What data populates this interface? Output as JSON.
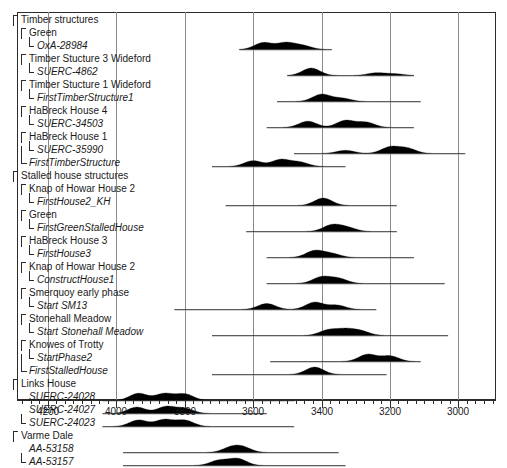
{
  "chart_data": {
    "type": "area",
    "title": "",
    "xlabel": "",
    "ylabel": "",
    "xlim": [
      4290,
      2890
    ],
    "x_axis_reversed": true,
    "grid": true,
    "legend": false,
    "axis_ticks_major": [
      4200,
      4000,
      3800,
      3600,
      3400,
      3200,
      3000
    ],
    "axis_tick_labels": [
      "4200",
      "4000",
      "3800",
      "3600",
      "3400",
      "3200",
      "3000"
    ],
    "axis_tick_minor_step": 25,
    "group_headers": [
      {
        "label": "Timber structures",
        "row": 0
      },
      {
        "label": "Stalled house structures",
        "row": 9
      }
    ],
    "rows": [
      {
        "label": "Timber structures",
        "kind": "group",
        "indent": 0,
        "bracket": "open"
      },
      {
        "label": "Green",
        "kind": "site",
        "indent": 1,
        "bracket": "open"
      },
      {
        "label": "OxA-28984",
        "kind": "date",
        "indent": 2,
        "bracket": "close",
        "range": [
          3640,
          3370
        ],
        "peaks": [
          [
            3570,
            1.0
          ],
          [
            3505,
            0.95
          ],
          [
            3455,
            0.55
          ]
        ]
      },
      {
        "label": "Timber Stucture 3 Wideford",
        "kind": "site",
        "indent": 1,
        "bracket": "open"
      },
      {
        "label": "SUERC-4862",
        "kind": "date",
        "indent": 2,
        "bracket": "close",
        "range": [
          3500,
          3130
        ],
        "peaks": [
          [
            3430,
            1.0
          ],
          [
            3240,
            0.35
          ],
          [
            3185,
            0.22
          ]
        ]
      },
      {
        "label": "Timber Stucture 1 Wideford",
        "kind": "site",
        "indent": 1,
        "bracket": "open"
      },
      {
        "label": "FirstTimberStructure1",
        "kind": "date",
        "indent": 2,
        "bracket": "close",
        "range": [
          3530,
          3110
        ],
        "peaks": [
          [
            3400,
            1.0
          ],
          [
            3340,
            0.45
          ]
        ]
      },
      {
        "label": "HaBreck House 4",
        "kind": "site",
        "indent": 1,
        "bracket": "open"
      },
      {
        "label": "SUERC-34503",
        "kind": "date",
        "indent": 2,
        "bracket": "close",
        "range": [
          3560,
          3130
        ],
        "peaks": [
          [
            3440,
            0.85
          ],
          [
            3330,
            0.95
          ],
          [
            3270,
            0.7
          ]
        ]
      },
      {
        "label": "HaBreck House 1",
        "kind": "site",
        "indent": 1,
        "bracket": "open"
      },
      {
        "label": "SUERC-35990",
        "kind": "date",
        "indent": 2,
        "bracket": "close",
        "range": [
          3480,
          2980
        ],
        "peaks": [
          [
            3330,
            0.5
          ],
          [
            3200,
            1.0
          ],
          [
            3150,
            0.8
          ]
        ]
      },
      {
        "label": "FirstTimberStructure",
        "kind": "derived",
        "indent": 1,
        "bracket": "close-long",
        "range": [
          3720,
          3330
        ],
        "peaks": [
          [
            3600,
            0.8
          ],
          [
            3520,
            0.95
          ],
          [
            3465,
            0.6
          ]
        ]
      },
      {
        "label": "Stalled house structures",
        "kind": "group",
        "indent": 0,
        "bracket": "open"
      },
      {
        "label": "Knap of Howar House 2",
        "kind": "site",
        "indent": 1,
        "bracket": "open"
      },
      {
        "label": "FirstHouse2_KH",
        "kind": "date",
        "indent": 2,
        "bracket": "close",
        "range": [
          3680,
          3180
        ],
        "peaks": [
          [
            3395,
            1.0
          ]
        ]
      },
      {
        "label": "Green",
        "kind": "site",
        "indent": 1,
        "bracket": "open"
      },
      {
        "label": "FirstGreenStalledHouse",
        "kind": "date",
        "indent": 2,
        "bracket": "close",
        "range": [
          3620,
          3180
        ],
        "peaks": [
          [
            3370,
            1.0
          ],
          [
            3325,
            0.6
          ]
        ]
      },
      {
        "label": "HaBreck House 3",
        "kind": "site",
        "indent": 1,
        "bracket": "open"
      },
      {
        "label": "FirstHouse3",
        "kind": "date",
        "indent": 2,
        "bracket": "close",
        "range": [
          3560,
          3130
        ],
        "peaks": [
          [
            3420,
            1.0
          ],
          [
            3370,
            0.55
          ]
        ]
      },
      {
        "label": "Knap of Howar House 2",
        "kind": "site",
        "indent": 1,
        "bracket": "open"
      },
      {
        "label": "ConstructHouse1",
        "kind": "date",
        "indent": 2,
        "bracket": "close",
        "range": [
          3560,
          3040
        ],
        "peaks": [
          [
            3400,
            1.0
          ],
          [
            3350,
            0.75
          ]
        ]
      },
      {
        "label": "Smerquoy early phase",
        "kind": "site",
        "indent": 1,
        "bracket": "open"
      },
      {
        "label": "Start SM13",
        "kind": "date",
        "indent": 2,
        "bracket": "close",
        "range": [
          3830,
          3240
        ],
        "peaks": [
          [
            3560,
            0.7
          ],
          [
            3420,
            0.85
          ],
          [
            3355,
            0.5
          ]
        ]
      },
      {
        "label": "Stonehall Meadow",
        "kind": "site",
        "indent": 1,
        "bracket": "open"
      },
      {
        "label": "Start Stonehall Meadow",
        "kind": "date",
        "indent": 2,
        "bracket": "close",
        "range": [
          3720,
          3030
        ],
        "peaks": [
          [
            3380,
            0.95
          ],
          [
            3330,
            1.0
          ],
          [
            3285,
            0.75
          ]
        ]
      },
      {
        "label": "Knowes of Trotty",
        "kind": "site",
        "indent": 1,
        "bracket": "open"
      },
      {
        "label": "StartPhase2",
        "kind": "date",
        "indent": 2,
        "bracket": "close",
        "range": [
          3550,
          3110
        ],
        "peaks": [
          [
            3265,
            0.9
          ],
          [
            3200,
            0.7
          ]
        ]
      },
      {
        "label": "FirstStalledHouse",
        "kind": "derived",
        "indent": 1,
        "bracket": "close-long",
        "range": [
          3720,
          3210
        ],
        "peaks": [
          [
            3420,
            1.0
          ]
        ]
      },
      {
        "label": "Links House",
        "kind": "site",
        "indent": 0,
        "bracket": "open"
      },
      {
        "label": "SUERC-24028",
        "kind": "date",
        "indent": 1,
        "bracket": "none",
        "range": [
          4040,
          3480
        ],
        "peaks": [
          [
            3935,
            1.0
          ],
          [
            3860,
            0.95
          ],
          [
            3800,
            0.9
          ]
        ]
      },
      {
        "label": "SUERC-24027",
        "kind": "date",
        "indent": 1,
        "bracket": "none",
        "range": [
          4040,
          3560
        ],
        "peaks": [
          [
            3940,
            0.9
          ],
          [
            3855,
            0.95
          ],
          [
            3800,
            0.7
          ]
        ]
      },
      {
        "label": "SUERC-24023",
        "kind": "date",
        "indent": 1,
        "bracket": "close",
        "range": [
          4040,
          3480
        ],
        "peaks": [
          [
            3935,
            0.95
          ],
          [
            3860,
            1.0
          ],
          [
            3800,
            0.9
          ]
        ]
      },
      {
        "label": "Varme Dale",
        "kind": "site",
        "indent": 0,
        "bracket": "open"
      },
      {
        "label": "AA-53158",
        "kind": "date",
        "indent": 1,
        "bracket": "none",
        "range": [
          3980,
          3350
        ],
        "peaks": [
          [
            3665,
            0.85
          ],
          [
            3630,
            0.9
          ]
        ]
      },
      {
        "label": "AA-53157",
        "kind": "date",
        "indent": 1,
        "bracket": "close",
        "range": [
          3980,
          3330
        ],
        "peaks": [
          [
            3700,
            0.75
          ],
          [
            3645,
            1.0
          ]
        ]
      }
    ],
    "colors": {
      "distribution_fill": "#000000",
      "grid": "#8a8a8a",
      "frame": "#2b2b2b",
      "text": "#1a1a1a"
    }
  }
}
